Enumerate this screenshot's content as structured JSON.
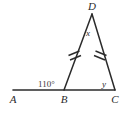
{
  "figure": {
    "kind": "triangle-geometry-diagram",
    "background_color": "#ffffff",
    "stroke_color": "#2b2b2b",
    "vertices": {
      "A": {
        "label": "A",
        "x": 13,
        "y": 90,
        "label_x": 14,
        "label_y": 102
      },
      "B": {
        "label": "B",
        "x": 64,
        "y": 90,
        "label_x": 65,
        "label_y": 102
      },
      "C": {
        "label": "C",
        "x": 115,
        "y": 90,
        "label_x": 115,
        "label_y": 102
      },
      "D": {
        "label": "D",
        "x": 92,
        "y": 14,
        "label_x": 92,
        "label_y": 9
      }
    },
    "angles": {
      "at_b_exterior": {
        "label": "110°",
        "x": 38,
        "y": 86
      },
      "at_d_apex": {
        "label": "x",
        "x": 88,
        "y": 34
      },
      "at_c_base": {
        "label": "y",
        "x": 104,
        "y": 86
      }
    },
    "tick_marks": {
      "count_per_leg": 2,
      "legs": [
        "BD",
        "CD"
      ],
      "meaning": "congruent-sides"
    }
  }
}
